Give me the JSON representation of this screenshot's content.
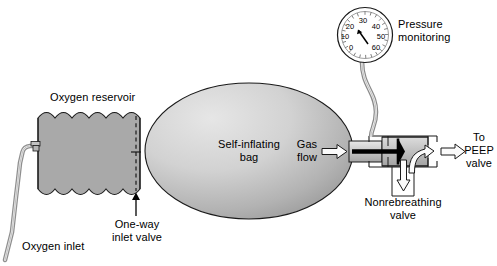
{
  "figure": {
    "type": "schematic-diagram"
  },
  "labels": {
    "oxygen_reservoir": "Oxygen reservoir",
    "oxygen_inlet": "Oxygen inlet",
    "one_way_inlet_valve": "One-way\ninlet valve",
    "self_inflating_bag": "Self-inflating\nbag",
    "gas_flow": "Gas\nflow",
    "pressure_monitoring": "Pressure\nmonitoring",
    "nonrebreathing_valve": "Nonrebreathing\nvalve",
    "to_peep_valve": "To\nPEEP\nvalve"
  },
  "gauge": {
    "name": "pressure-gauge",
    "ticks": [
      "0",
      "10",
      "20",
      "30",
      "40",
      "50",
      "60"
    ],
    "needle_value": "15",
    "unit": ""
  },
  "flow_arrows": [
    {
      "id": "gas-flow-arrow",
      "direction": "right",
      "label": "Gas flow into valve"
    },
    {
      "id": "exhalation-arrow",
      "direction": "down",
      "label": "Exhaled gas out"
    },
    {
      "id": "inspiratory-arrow",
      "direction": "up-right",
      "label": "Gas to patient"
    },
    {
      "id": "peep-outlet-arrow",
      "direction": "right",
      "label": "To PEEP valve"
    },
    {
      "id": "one-way-valve-arrow",
      "direction": "up",
      "label": "One-way inlet valve pointer"
    }
  ],
  "colors": {
    "stroke": "#000000",
    "reservoir_fill": "#a9a9a9",
    "bag_light": "#e2e2e2",
    "bag_dark": "#9d9d9d",
    "valve_fill": "#bdbdbd",
    "tube_fill": "#cfcfcf",
    "arrow_fill": "#f2f2f2",
    "background": "#ffffff"
  }
}
